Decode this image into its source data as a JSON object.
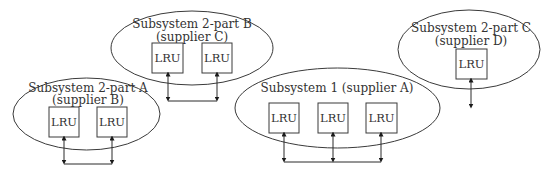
{
  "diagram": {
    "subsystems": [
      {
        "id": "2A",
        "title": "Subsystem 2-part A",
        "supplier": "(supplier B)",
        "lrus": [
          "LRU",
          "LRU"
        ]
      },
      {
        "id": "2B",
        "title": "Subsystem 2-part B",
        "supplier": "(supplier C)",
        "lrus": [
          "LRU",
          "LRU"
        ]
      },
      {
        "id": "1",
        "title": "Subsystem 1 (supplier A)",
        "supplier": "",
        "lrus": [
          "LRU",
          "LRU",
          "LRU"
        ]
      },
      {
        "id": "2C",
        "title": "Subsystem 2-part C",
        "supplier": "(supplier D)",
        "lrus": [
          "LRU"
        ]
      }
    ],
    "colors": {
      "stroke": "#3a3a3a",
      "text": "#333333",
      "background": "#ffffff"
    }
  }
}
